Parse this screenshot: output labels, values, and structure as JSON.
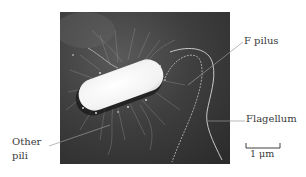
{
  "figure": {
    "labels": {
      "f_pilus": "F pilus",
      "flagellum": "Flagellum",
      "other_pili_line1": "Other",
      "other_pili_line2": "pili"
    },
    "scale_bar": {
      "label": "1 μm"
    },
    "colors": {
      "photo_background": "#3b3b3b",
      "cell_body": "#f7f7f7",
      "leader_line": "#8a8a8a",
      "text": "#3a3a3a"
    }
  }
}
